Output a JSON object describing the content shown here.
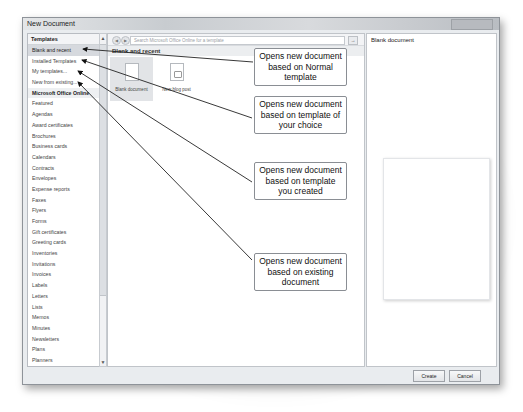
{
  "window": {
    "title": "New Document"
  },
  "sidebar": {
    "header": "Templates",
    "items": [
      {
        "label": "Blank and recent",
        "selected": true
      },
      {
        "label": "Installed Templates"
      },
      {
        "label": "My templates..."
      },
      {
        "label": "New from existing..."
      },
      {
        "label": "Microsoft Office Online",
        "group": true
      },
      {
        "label": "Featured"
      },
      {
        "label": "Agendas"
      },
      {
        "label": "Award certificates"
      },
      {
        "label": "Brochures"
      },
      {
        "label": "Business cards"
      },
      {
        "label": "Calendars"
      },
      {
        "label": "Contracts"
      },
      {
        "label": "Envelopes"
      },
      {
        "label": "Expense reports"
      },
      {
        "label": "Faxes"
      },
      {
        "label": "Flyers"
      },
      {
        "label": "Forms"
      },
      {
        "label": "Gift certificates"
      },
      {
        "label": "Greeting cards"
      },
      {
        "label": "Inventories"
      },
      {
        "label": "Invitations"
      },
      {
        "label": "Invoices"
      },
      {
        "label": "Labels"
      },
      {
        "label": "Letters"
      },
      {
        "label": "Lists"
      },
      {
        "label": "Memos"
      },
      {
        "label": "Minutes"
      },
      {
        "label": "Newsletters"
      },
      {
        "label": "Plans"
      },
      {
        "label": "Planners"
      }
    ]
  },
  "toolbar": {
    "back_icon": "back-arrow-icon",
    "forward_icon": "forward-arrow-icon",
    "search_placeholder": "Search Microsoft Office Online for a template",
    "search_button": "→"
  },
  "main": {
    "section_title": "Blank and recent",
    "tiles": [
      {
        "label": "Blank document",
        "icon": "blank-document-icon",
        "selected": true
      },
      {
        "label": "New blog post",
        "icon": "blog-post-icon"
      }
    ]
  },
  "preview": {
    "title": "Blank document"
  },
  "footer": {
    "create_label": "Create",
    "cancel_label": "Cancel"
  },
  "callouts": [
    {
      "text": "Opens new document based on Normal template"
    },
    {
      "text": "Opens new document based on template of your choice"
    },
    {
      "text": "Opens new document based on template you created"
    },
    {
      "text": "Opens new document based on existing document"
    }
  ],
  "colors": {
    "window_bg": "#e9ecef",
    "selected_item": "#d6d9de",
    "border": "#8e9399"
  }
}
